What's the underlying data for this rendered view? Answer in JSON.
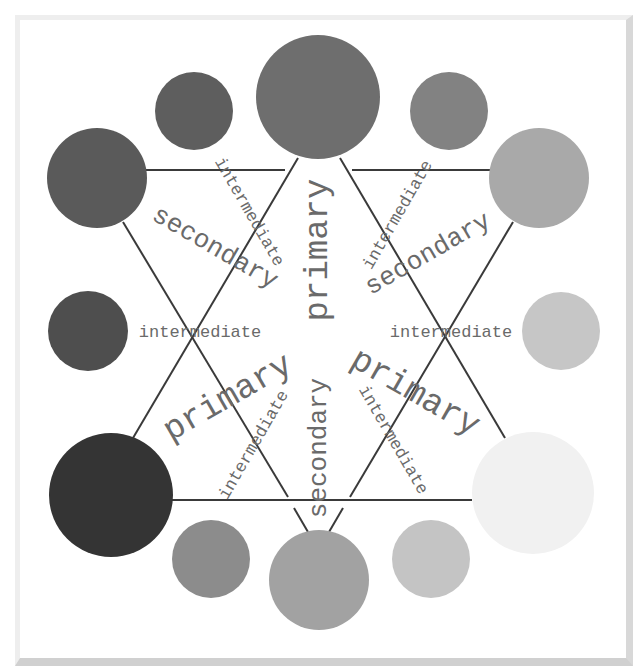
{
  "diagram": {
    "type": "color-wheel",
    "rendering": "grayscale",
    "circles": [
      {
        "id": "primary-top",
        "category": "primary",
        "cx": 318,
        "cy": 97,
        "r": 62,
        "fill": "#6e6e6e"
      },
      {
        "id": "intermediate-top-right",
        "category": "intermediate",
        "cx": 449,
        "cy": 111,
        "r": 39,
        "fill": "#828282"
      },
      {
        "id": "secondary-upper-right",
        "category": "secondary",
        "cx": 539,
        "cy": 178,
        "r": 50,
        "fill": "#a9a9a9"
      },
      {
        "id": "intermediate-right",
        "category": "intermediate",
        "cx": 561,
        "cy": 331,
        "r": 39,
        "fill": "#c6c6c6"
      },
      {
        "id": "primary-bottom-right",
        "category": "primary",
        "cx": 533,
        "cy": 493,
        "r": 61,
        "fill": "#f1f1f1"
      },
      {
        "id": "intermediate-bottom-right",
        "category": "intermediate",
        "cx": 431,
        "cy": 559,
        "r": 39,
        "fill": "#c4c4c4"
      },
      {
        "id": "secondary-bottom",
        "category": "secondary",
        "cx": 319,
        "cy": 580,
        "r": 50,
        "fill": "#a2a2a2"
      },
      {
        "id": "intermediate-bottom-left",
        "category": "intermediate",
        "cx": 211,
        "cy": 559,
        "r": 39,
        "fill": "#8c8c8c"
      },
      {
        "id": "primary-bottom-left",
        "category": "primary",
        "cx": 111,
        "cy": 495,
        "r": 62,
        "fill": "#343434"
      },
      {
        "id": "intermediate-left",
        "category": "intermediate",
        "cx": 88,
        "cy": 331,
        "r": 40,
        "fill": "#4e4e4e"
      },
      {
        "id": "secondary-upper-left",
        "category": "secondary",
        "cx": 97,
        "cy": 178,
        "r": 50,
        "fill": "#5a5a5a"
      },
      {
        "id": "intermediate-top-left",
        "category": "intermediate",
        "cx": 194,
        "cy": 111,
        "r": 39,
        "fill": "#5e5e5e"
      }
    ],
    "lines": [
      {
        "id": "top-bar-left",
        "x1": 146,
        "y1": 170,
        "x2": 285,
        "y2": 170
      },
      {
        "id": "top-bar-right",
        "x1": 352,
        "y1": 170,
        "x2": 490,
        "y2": 170
      },
      {
        "id": "bottom-bar",
        "x1": 172,
        "y1": 500,
        "x2": 472,
        "y2": 500
      },
      {
        "id": "primary-left",
        "x1": 298,
        "y1": 158,
        "x2": 133,
        "y2": 438
      },
      {
        "id": "primary-right",
        "x1": 340,
        "y1": 158,
        "x2": 505,
        "y2": 438
      },
      {
        "id": "secondary-left",
        "x1": 123,
        "y1": 222,
        "x2": 288,
        "y2": 497
      },
      {
        "id": "secondary-left-stub",
        "x1": 294,
        "y1": 508,
        "x2": 308,
        "y2": 532
      },
      {
        "id": "secondary-right",
        "x1": 513,
        "y1": 222,
        "x2": 350,
        "y2": 497
      },
      {
        "id": "secondary-right-stub",
        "x1": 343,
        "y1": 508,
        "x2": 329,
        "y2": 532
      }
    ],
    "labels": [
      {
        "id": "primary-center-top",
        "text": "primary",
        "category": "primary",
        "x": 318,
        "y": 250,
        "rotate": -90
      },
      {
        "id": "primary-lower-left",
        "text": "primary",
        "category": "primary",
        "x": 228,
        "y": 398,
        "rotate": -30
      },
      {
        "id": "primary-lower-right",
        "text": "primary",
        "category": "primary",
        "x": 415,
        "y": 393,
        "rotate": 30
      },
      {
        "id": "secondary-upper-left",
        "text": "secondary",
        "category": "secondary",
        "x": 215,
        "y": 248,
        "rotate": 30
      },
      {
        "id": "secondary-upper-right",
        "text": "secondary",
        "category": "secondary",
        "x": 428,
        "y": 254,
        "rotate": -30
      },
      {
        "id": "secondary-bottom",
        "text": "secondary",
        "category": "secondary",
        "x": 319,
        "y": 448,
        "rotate": -90
      },
      {
        "id": "intermediate-left",
        "text": "intermediate",
        "category": "intermediate",
        "x": 200,
        "y": 332,
        "rotate": 0
      },
      {
        "id": "intermediate-right",
        "text": "intermediate",
        "category": "intermediate",
        "x": 451,
        "y": 332,
        "rotate": 0
      },
      {
        "id": "intermediate-top-left",
        "text": "intermediate",
        "category": "intermediate",
        "x": 249,
        "y": 212,
        "rotate": 60
      },
      {
        "id": "intermediate-top-right",
        "text": "intermediate",
        "category": "intermediate",
        "x": 398,
        "y": 215,
        "rotate": -60
      },
      {
        "id": "intermediate-bottom-left",
        "text": "intermediate",
        "category": "intermediate",
        "x": 254,
        "y": 445,
        "rotate": -60
      },
      {
        "id": "intermediate-bottom-right",
        "text": "intermediate",
        "category": "intermediate",
        "x": 393,
        "y": 440,
        "rotate": 60
      }
    ],
    "line_color": "#3a3a3a",
    "frame_color": "#dddddd"
  }
}
